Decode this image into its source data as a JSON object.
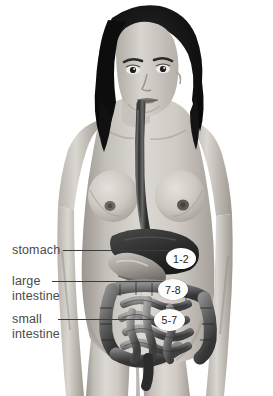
{
  "figure": {
    "background_color": "#ffffff",
    "palette": {
      "skin_light": "#d9d5d0",
      "skin_mid": "#b9b4ae",
      "skin_shadow": "#8f8a85",
      "hair_dark": "#141414",
      "organ_dark": "#3b3b3b",
      "organ_mid": "#6e6e6e",
      "organ_light": "#a8a8a8",
      "badge_fill": "#fdfdfb",
      "leader_line": "#3c3c3c",
      "label_text": "#4a4a4a"
    }
  },
  "labels": [
    {
      "id": "stomach",
      "text": "stomach",
      "lines": [
        "stomach"
      ]
    },
    {
      "id": "large-intestine",
      "text": "large intestine",
      "lines": [
        "large",
        "intestine"
      ]
    },
    {
      "id": "small-intestine",
      "text": "small intestine",
      "lines": [
        "small",
        "intestine"
      ]
    }
  ],
  "badges": [
    {
      "id": "stomach-time",
      "value": "1-2",
      "organ": "stomach",
      "unit_implied": "hours"
    },
    {
      "id": "large-intestine-time",
      "value": "7-8",
      "organ": "large intestine",
      "unit_implied": "hours"
    },
    {
      "id": "small-intestine-time",
      "value": "5-7",
      "organ": "small intestine",
      "unit_implied": "hours"
    }
  ],
  "anatomy": [
    {
      "name": "hair",
      "visible": true
    },
    {
      "name": "face",
      "visible": true
    },
    {
      "name": "torso",
      "visible": true
    },
    {
      "name": "esophagus",
      "visible": true
    },
    {
      "name": "liver",
      "visible": true
    },
    {
      "name": "stomach",
      "visible": true
    },
    {
      "name": "large-intestine",
      "visible": true
    },
    {
      "name": "small-intestine",
      "visible": true
    },
    {
      "name": "rectum",
      "visible": true
    }
  ]
}
